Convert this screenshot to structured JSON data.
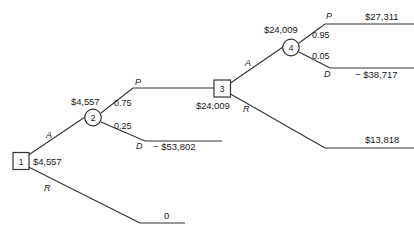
{
  "diagram": {
    "type": "decision-tree",
    "line_color": "#333333",
    "text_color": "#1a1a1a"
  },
  "nodes": [
    {
      "id": "1",
      "shape": "square",
      "label": "1",
      "value": "$4,557"
    },
    {
      "id": "2",
      "shape": "circle",
      "label": "2",
      "value": "$4,557"
    },
    {
      "id": "3",
      "shape": "square",
      "label": "3",
      "value": "$24,009"
    },
    {
      "id": "4",
      "shape": "circle",
      "label": "4",
      "value": "$24,009"
    }
  ],
  "branches": {
    "n1_accept": "A",
    "n1_reject": "R",
    "n2_pass": "P",
    "n2_pass_prob": "0.75",
    "n2_defect": "D",
    "n2_defect_prob": "0.25",
    "n3_accept": "A",
    "n3_reject": "R",
    "n4_pass": "P",
    "n4_pass_prob": "0.95",
    "n4_defect": "D",
    "n4_defect_prob": "0.05"
  },
  "outcomes": [
    {
      "id": "outcome-27311",
      "value": "$27,311"
    },
    {
      "id": "outcome-38717",
      "value": "− $38,717"
    },
    {
      "id": "outcome-53802",
      "value": "− $53,802"
    },
    {
      "id": "outcome-13818",
      "value": "$13,818"
    },
    {
      "id": "outcome-zero",
      "value": "0"
    }
  ]
}
